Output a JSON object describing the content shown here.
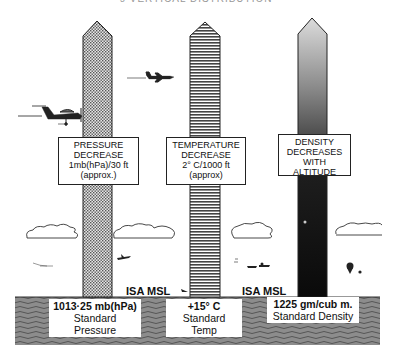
{
  "header": {
    "text": "ɔ  VERTICAL DISTRIBUTION"
  },
  "columns": [
    {
      "name": "pressure",
      "pattern": "dotted",
      "label": [
        "PRESSURE",
        "DECREASE",
        "1mb(hPa)/30 ft",
        "(approx.)"
      ],
      "base_value": "1013·25 mb(hPa)",
      "base_caption": "Standard Pressure"
    },
    {
      "name": "temperature",
      "pattern": "horizontal-stripes",
      "label": [
        "TEMPERATURE",
        "DECREASE",
        "2° C/1000 ft",
        "(approx)"
      ],
      "base_value": "+15° C",
      "base_caption": "Standard Temp"
    },
    {
      "name": "density",
      "pattern": "gradient-dark",
      "label": [
        "DENSITY",
        "DECREASES",
        "WITH",
        "ALTITUDE"
      ],
      "base_value": "1225 gm/cub m.",
      "base_caption": "Standard Density"
    }
  ],
  "isa_labels": [
    "ISA MSL",
    "ISA MSL"
  ],
  "colors": {
    "ink": "#1a1a1a",
    "ground": "#8a8a8a",
    "density_top": "#d8d8d8",
    "density_bottom": "#0a0a0a"
  }
}
